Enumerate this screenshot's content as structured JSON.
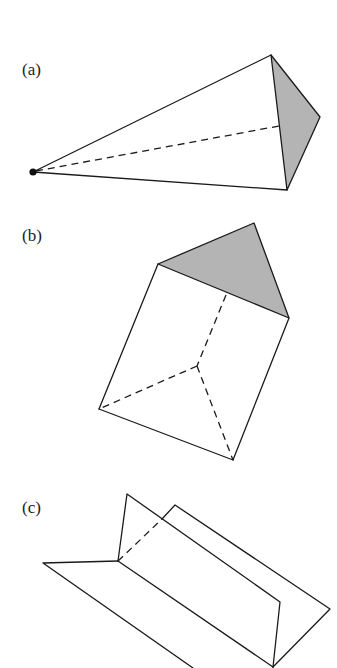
{
  "figure": {
    "colors": {
      "line": "#1a1a1a",
      "shade": "#b4b4b4",
      "background": "#ffffff"
    },
    "panels": [
      {
        "id": "a",
        "label": "(a)",
        "description": "Pyramid/cone over a triangular base, apex point on left, shaded triangular face on right"
      },
      {
        "id": "b",
        "label": "(b)",
        "description": "Triangular prism seen obliquely, shaded triangular end face on top"
      },
      {
        "id": "c",
        "label": "(c)",
        "description": "Folded sheet forming two intersecting planes (dihedral angle) with a hidden dashed edge"
      }
    ]
  }
}
